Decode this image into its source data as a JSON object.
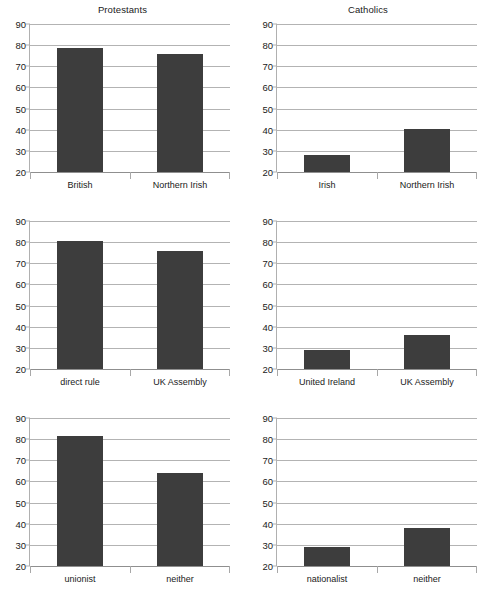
{
  "figure": {
    "background": "#ffffff",
    "bar_color": "#3d3d3d",
    "gridline_color": "#b3b3b3",
    "axis_color": "#b0b0b0",
    "text_color": "#1a1a1a"
  },
  "chart_data": [
    {
      "type": "bar",
      "title": "Protestants",
      "categories": [
        "British",
        "Northern Irish"
      ],
      "values": [
        78.5,
        76
      ],
      "xlabel": "",
      "ylabel": "",
      "ylim": [
        20,
        90
      ],
      "yticks": [
        20,
        30,
        40,
        50,
        60,
        70,
        80,
        90
      ],
      "grid": true,
      "legend": "none",
      "panel": "top-left"
    },
    {
      "type": "bar",
      "title": "Catholics",
      "categories": [
        "Irish",
        "Northern Irish"
      ],
      "values": [
        28,
        40.5
      ],
      "xlabel": "",
      "ylabel": "",
      "ylim": [
        20,
        90
      ],
      "yticks": [
        20,
        30,
        40,
        50,
        60,
        70,
        80,
        90
      ],
      "grid": true,
      "legend": "none",
      "panel": "top-right"
    },
    {
      "type": "bar",
      "title": "",
      "categories": [
        "direct rule",
        "UK Assembly"
      ],
      "values": [
        80.5,
        76
      ],
      "xlabel": "",
      "ylabel": "",
      "ylim": [
        20,
        90
      ],
      "yticks": [
        20,
        30,
        40,
        50,
        60,
        70,
        80,
        90
      ],
      "grid": true,
      "legend": "none",
      "panel": "middle-left"
    },
    {
      "type": "bar",
      "title": "",
      "categories": [
        "United Ireland",
        "UK Assembly"
      ],
      "values": [
        29,
        36
      ],
      "xlabel": "",
      "ylabel": "",
      "ylim": [
        20,
        90
      ],
      "yticks": [
        20,
        30,
        40,
        50,
        60,
        70,
        80,
        90
      ],
      "grid": true,
      "legend": "none",
      "panel": "middle-right"
    },
    {
      "type": "bar",
      "title": "",
      "categories": [
        "unionist",
        "neither"
      ],
      "values": [
        81.5,
        64
      ],
      "xlabel": "",
      "ylabel": "",
      "ylim": [
        20,
        90
      ],
      "yticks": [
        20,
        30,
        40,
        50,
        60,
        70,
        80,
        90
      ],
      "grid": true,
      "legend": "none",
      "panel": "bottom-left"
    },
    {
      "type": "bar",
      "title": "",
      "categories": [
        "nationalist",
        "neither"
      ],
      "values": [
        29,
        38
      ],
      "xlabel": "",
      "ylabel": "",
      "ylim": [
        20,
        90
      ],
      "yticks": [
        20,
        30,
        40,
        50,
        60,
        70,
        80,
        90
      ],
      "grid": true,
      "legend": "none",
      "panel": "bottom-right"
    }
  ]
}
